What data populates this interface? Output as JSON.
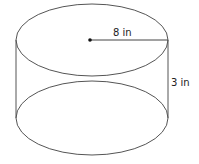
{
  "diagram": {
    "shape": "cylinder",
    "radius_label": "8 in",
    "height_label": "3 in",
    "colors": {
      "stroke": "#555555",
      "text": "#222222",
      "background": "#ffffff"
    },
    "top_ellipse": {
      "cx": 92,
      "cy": 40,
      "rx": 76,
      "ry": 36
    },
    "bottom_ellipse": {
      "cx": 92,
      "cy": 118,
      "rx": 76,
      "ry": 37
    }
  }
}
